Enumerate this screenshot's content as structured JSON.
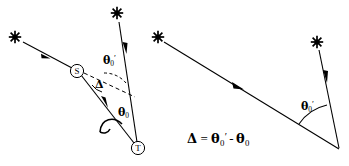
{
  "figure": {
    "background_color": "#ffffff",
    "stroke_color": "#000000",
    "left_panel": {
      "name": "refracted ray panel",
      "nodes": [
        {
          "id": "S",
          "label": "S",
          "x": 77,
          "y": 71,
          "shape": "circle"
        },
        {
          "id": "T",
          "label": "T",
          "x": 138,
          "y": 148,
          "shape": "circle"
        }
      ],
      "stars": [
        {
          "name": "star-upper-left",
          "x": 15,
          "y": 37
        },
        {
          "name": "star-top",
          "x": 117,
          "y": 13
        }
      ],
      "angle_labels": [
        {
          "name": "theta-zero-prime-upper",
          "theta": "θ",
          "sub": "0",
          "prime": "′",
          "x": 103,
          "y": 54
        },
        {
          "name": "delta",
          "theta": "Δ",
          "sub": "",
          "prime": "",
          "x": 95,
          "y": 79
        },
        {
          "name": "theta-zero-lower",
          "theta": "θ",
          "sub": "0",
          "prime": "",
          "x": 118,
          "y": 107
        }
      ]
    },
    "right_panel": {
      "name": "unrefracted ray panel",
      "stars": [
        {
          "name": "star-left",
          "x": 158,
          "y": 37
        },
        {
          "name": "star-right",
          "x": 317,
          "y": 42
        }
      ],
      "vertex": {
        "name": "vertex",
        "x": 340,
        "y": 150
      },
      "angle_labels": [
        {
          "name": "theta-zero-prime",
          "theta": "θ",
          "sub": "0",
          "prime": "′",
          "x": 301,
          "y": 100
        }
      ]
    },
    "equation": {
      "name": "delta-equation",
      "delta": "Δ",
      "relation": "=",
      "term1_theta": "θ",
      "term1_sub": "0",
      "term1_prime": "′",
      "minus": "-",
      "term2_theta": "θ",
      "term2_sub": "0",
      "x": 187,
      "y": 131,
      "text_plain": "Δ = θ₀′ - θ₀"
    }
  }
}
